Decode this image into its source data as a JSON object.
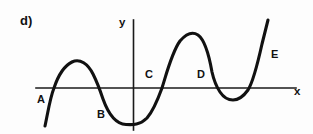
{
  "figure": {
    "part_label": "d)",
    "background_color": "#fdfdfd",
    "ink_color": "#111111"
  },
  "axes": {
    "x_axis_label": "x",
    "y_axis_label": "y",
    "x_axis": {
      "y_pixel": 88,
      "x_start": 36,
      "x_end": 296
    },
    "y_axis": {
      "x_pixel": 133,
      "y_start": 20,
      "y_end": 130
    }
  },
  "point_labels": [
    {
      "id": "A",
      "text": "A",
      "note": "below axis, left of first rising branch"
    },
    {
      "id": "B",
      "text": "B",
      "note": "below axis, left of first valley"
    },
    {
      "id": "C",
      "text": "C",
      "note": "above axis, left of middle rising zero"
    },
    {
      "id": "D",
      "text": "D",
      "note": "above axis, left of descending branch"
    },
    {
      "id": "E",
      "text": "E",
      "note": "right of final steeply rising branch"
    }
  ],
  "chart_data": {
    "type": "line",
    "title": "d)",
    "xlabel": "x",
    "ylabel": "y",
    "grid": false,
    "legend": null,
    "zeros_pixel_x": [
      53,
      101,
      162,
      215,
      250
    ],
    "turning_points_pixel": [
      {
        "kind": "local-maximum",
        "x": 77,
        "y": 62
      },
      {
        "kind": "local-minimum",
        "x": 139,
        "y": 124
      },
      {
        "kind": "local-maximum",
        "x": 190,
        "y": 33
      },
      {
        "kind": "local-minimum",
        "x": 232,
        "y": 100
      }
    ],
    "endpoints_pixel": [
      {
        "kind": "start",
        "x": 45,
        "y": 126
      },
      {
        "kind": "end",
        "x": 268,
        "y": 20
      }
    ],
    "curve_path": "M 45,126 C 48,112 50,98 54,88 C 58,76 64,66 72,62 C 80,58 88,64 93,74 C 98,84 100,90 103,99 C 108,113 116,124 126,124.5 C 133,125 140,125 147,118 C 154,110 158,99 162,88 C 167,72 172,52 180,41 C 186,34 192,31 198,35 C 205,40 209,55 212,72 C 214,81 216,86 220,92 C 224,98 228,100 233,100 C 238,100 243,97 248,90 C 253,82 258,62 262,44 C 265,32 267,24 268,20"
  }
}
